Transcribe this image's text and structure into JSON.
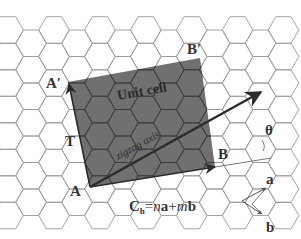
{
  "diagram": {
    "colors": {
      "background": "#ffffff",
      "hex_line": "#9a9a9a",
      "hex_line_dark": "#3c3c3c",
      "unit_cell_fill": "#6b6b6b",
      "arrow": "#2b2b2b",
      "label": "#333333"
    },
    "grid": {
      "hex_radius": 15.3,
      "origin_x": 54,
      "origin_y": 30,
      "cols_min": -3,
      "cols_max": 10,
      "rows_min": -2,
      "rows_max": 9
    },
    "points": {
      "A": [
        90,
        187
      ],
      "B": [
        215,
        167
      ],
      "B_prime": [
        200,
        58
      ],
      "A_prime": [
        68,
        82
      ],
      "zigzag_tip": [
        261,
        92
      ],
      "ab_origin": [
        242,
        201
      ],
      "a_tip": [
        266,
        188
      ],
      "b_tip": [
        262,
        214
      ]
    },
    "labels": {
      "A": "A",
      "B": "B",
      "A_prime": "A′",
      "B_prime": "B′",
      "T": "T",
      "theta": "θ",
      "a": "a",
      "b": "b",
      "unit_cell": "Unit cell",
      "zigzag_axis": "zigzag axis",
      "chiral_C": "C",
      "chiral_sub": "h",
      "chiral_rest_eq": "=",
      "chiral_n": "n",
      "chiral_a": "a",
      "chiral_plus": "+",
      "chiral_m": "m",
      "chiral_b": "b"
    },
    "label_positions": {
      "A": [
        70,
        196
      ],
      "B": [
        218,
        159
      ],
      "A_prime": [
        46,
        88
      ],
      "B_prime": [
        187,
        54
      ],
      "T": [
        65,
        146
      ],
      "theta": [
        265,
        135
      ],
      "a": [
        266,
        184
      ],
      "b": [
        266,
        232
      ],
      "unit_cell": [
        118,
        100
      ],
      "chiral": [
        129,
        211
      ]
    }
  }
}
